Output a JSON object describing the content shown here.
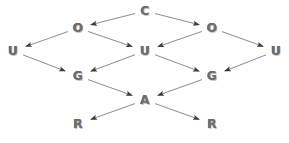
{
  "diagram": {
    "style": {
      "background_color": "#ffffff",
      "node_text_color": "#6e6e6e",
      "node_highlight_color": "#c9c9c9",
      "node_shadow_color": "#4a4a4a",
      "edge_color": "#8c8c8c",
      "arrowhead_color": "#3a3a3a"
    },
    "nodes": [
      {
        "id": "c",
        "label": "C",
        "x": 145,
        "y": 11,
        "row": 0
      },
      {
        "id": "o1",
        "label": "O",
        "x": 78,
        "y": 28,
        "row": 1
      },
      {
        "id": "o2",
        "label": "O",
        "x": 212,
        "y": 28,
        "row": 1
      },
      {
        "id": "u1",
        "label": "U",
        "x": 13,
        "y": 51,
        "row": 2
      },
      {
        "id": "u2",
        "label": "U",
        "x": 145,
        "y": 51,
        "row": 2
      },
      {
        "id": "u3",
        "label": "U",
        "x": 276,
        "y": 51,
        "row": 2
      },
      {
        "id": "g1",
        "label": "G",
        "x": 78,
        "y": 76,
        "row": 3
      },
      {
        "id": "g2",
        "label": "G",
        "x": 212,
        "y": 76,
        "row": 3
      },
      {
        "id": "a",
        "label": "A",
        "x": 145,
        "y": 100,
        "row": 4
      },
      {
        "id": "r1",
        "label": "R",
        "x": 78,
        "y": 124,
        "row": 5
      },
      {
        "id": "r2",
        "label": "R",
        "x": 212,
        "y": 124,
        "row": 5
      }
    ],
    "edges": [
      {
        "from": "c",
        "to": "o1",
        "direction": "down-left"
      },
      {
        "from": "c",
        "to": "o2",
        "direction": "down-right"
      },
      {
        "from": "o1",
        "to": "u1",
        "direction": "down-left"
      },
      {
        "from": "o1",
        "to": "u2",
        "direction": "down-right"
      },
      {
        "from": "o2",
        "to": "u2",
        "direction": "down-left"
      },
      {
        "from": "o2",
        "to": "u3",
        "direction": "down-right"
      },
      {
        "from": "u1",
        "to": "g1",
        "direction": "down-right"
      },
      {
        "from": "u2",
        "to": "g1",
        "direction": "down-left"
      },
      {
        "from": "u2",
        "to": "g2",
        "direction": "down-right"
      },
      {
        "from": "u3",
        "to": "g2",
        "direction": "down-left"
      },
      {
        "from": "g1",
        "to": "a",
        "direction": "down-right"
      },
      {
        "from": "g2",
        "to": "a",
        "direction": "down-left"
      },
      {
        "from": "a",
        "to": "r1",
        "direction": "down-left"
      },
      {
        "from": "a",
        "to": "r2",
        "direction": "down-right"
      }
    ]
  }
}
